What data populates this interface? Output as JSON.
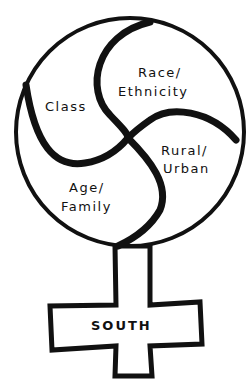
{
  "diagram": {
    "type": "venus-symbol-with-triskelion",
    "segments": [
      {
        "id": "race",
        "line1": "Race/",
        "line2": "Ethnicity"
      },
      {
        "id": "class",
        "line1": "Class",
        "line2": ""
      },
      {
        "id": "rural",
        "line1": "Rural/",
        "line2": "Urban"
      },
      {
        "id": "age",
        "line1": "Age/",
        "line2": "Family"
      }
    ],
    "cross_label": "SOUTH",
    "colors": {
      "ink": "#111111",
      "background": "#ffffff"
    }
  }
}
